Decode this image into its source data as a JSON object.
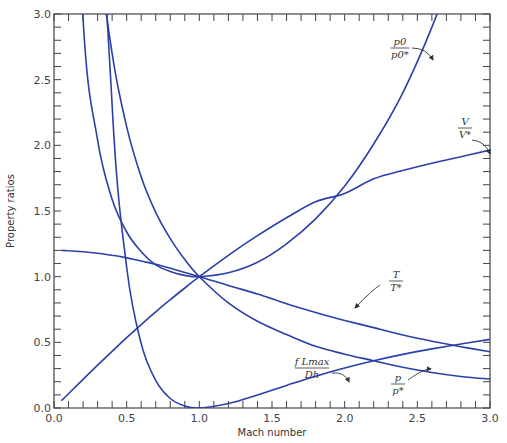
{
  "chart_data": {
    "type": "line",
    "title": "",
    "xlabel": "Mach number",
    "ylabel": "Property ratios",
    "xlim": [
      0.0,
      3.0
    ],
    "ylim": [
      0.0,
      3.0
    ],
    "x_ticks": [
      "0.0",
      "0.5",
      "1.0",
      "1.5",
      "2.0",
      "2.5",
      "3.0"
    ],
    "y_ticks": [
      "0.0",
      "0.5",
      "1.0",
      "1.5",
      "2.0",
      "2.5",
      "3.0"
    ],
    "grid": false,
    "legend": "none (curves labeled inline with arrows)",
    "line_color": "#2b3fa8",
    "x": [
      0.05,
      0.1,
      0.2,
      0.3,
      0.4,
      0.5,
      0.6,
      0.7,
      0.8,
      0.9,
      1.0,
      1.2,
      1.4,
      1.6,
      1.8,
      2.0,
      2.2,
      2.4,
      2.6,
      2.8,
      3.0
    ],
    "series": [
      {
        "name": "p0/p0*",
        "label_num": "p0",
        "label_den": "p0*",
        "values": [
          11.59,
          5.82,
          2.96,
          2.04,
          1.59,
          1.34,
          1.19,
          1.09,
          1.04,
          1.01,
          1.0,
          1.03,
          1.11,
          1.25,
          1.44,
          1.69,
          2.01,
          2.4,
          2.9,
          3.5,
          4.23
        ]
      },
      {
        "name": "V/V*",
        "label_num": "V",
        "label_den": "V*",
        "values": [
          0.055,
          0.109,
          0.218,
          0.326,
          0.431,
          0.535,
          0.635,
          0.732,
          0.825,
          0.914,
          1.0,
          1.163,
          1.312,
          1.448,
          1.571,
          1.633,
          1.745,
          1.808,
          1.863,
          1.913,
          1.964
        ]
      },
      {
        "name": "T/T*",
        "label_num": "T",
        "label_den": "T*",
        "values": [
          1.2,
          1.198,
          1.19,
          1.179,
          1.163,
          1.143,
          1.119,
          1.094,
          1.064,
          1.032,
          1.0,
          0.933,
          0.868,
          0.794,
          0.728,
          0.667,
          0.612,
          0.556,
          0.509,
          0.466,
          0.429
        ]
      },
      {
        "name": "p/p*",
        "label_num": "p",
        "label_den": "p*",
        "values": [
          21.91,
          10.94,
          5.45,
          3.62,
          2.7,
          2.14,
          1.76,
          1.49,
          1.29,
          1.13,
          1.0,
          0.8,
          0.66,
          0.56,
          0.47,
          0.41,
          0.36,
          0.31,
          0.27,
          0.24,
          0.22
        ]
      },
      {
        "name": "fLmax/Dh",
        "label_num": "f Lmax",
        "label_den": "Dh",
        "values": [
          280.0,
          66.92,
          14.53,
          5.3,
          2.31,
          1.07,
          0.49,
          0.21,
          0.072,
          0.015,
          0.0,
          0.034,
          0.1,
          0.172,
          0.242,
          0.305,
          0.36,
          0.408,
          0.45,
          0.487,
          0.522
        ]
      }
    ],
    "annotations": [
      {
        "text": "p0/p0*",
        "near_x": 2.65,
        "near_y": 2.7
      },
      {
        "text": "V/V*",
        "near_x": 2.75,
        "near_y": 1.75
      },
      {
        "text": "T/T*",
        "near_x": 1.95,
        "near_y": 0.72
      },
      {
        "text": "p/p*",
        "near_x": 2.65,
        "near_y": 0.25
      },
      {
        "text": "fLmax/Dh",
        "near_x": 1.65,
        "near_y": 0.2
      }
    ]
  }
}
